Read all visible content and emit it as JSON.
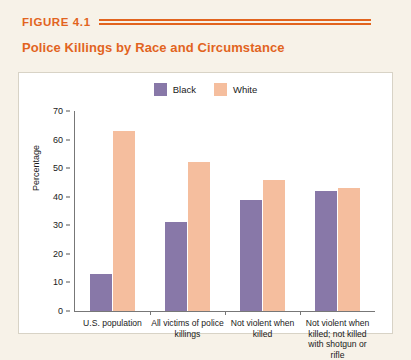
{
  "figure": {
    "label": "FIGURE 4.1",
    "title": "Police Killings by Race and Circumstance"
  },
  "colors": {
    "accent": "#e2641e",
    "black_series": "#8878a8",
    "white_series": "#f5be9e",
    "page_background": "#f7f2e8",
    "panel_background": "#ffffff"
  },
  "chart_data": {
    "type": "bar",
    "title": "Police Killings by Race and Circumstance",
    "xlabel": "",
    "ylabel": "Percentage",
    "ylim": [
      0,
      70
    ],
    "yticks": [
      0,
      10,
      20,
      30,
      40,
      50,
      60,
      70
    ],
    "grid": false,
    "legend_position": "top-center",
    "categories": [
      "U.S. population",
      "All victims of police killings",
      "Not violent when killed",
      "Not violent when killed; not killed with shotgun or rifle"
    ],
    "series": [
      {
        "name": "Black",
        "color": "#8878a8",
        "values": [
          13,
          31,
          39,
          42
        ]
      },
      {
        "name": "White",
        "color": "#f5be9e",
        "values": [
          63,
          52,
          46,
          43
        ]
      }
    ]
  }
}
